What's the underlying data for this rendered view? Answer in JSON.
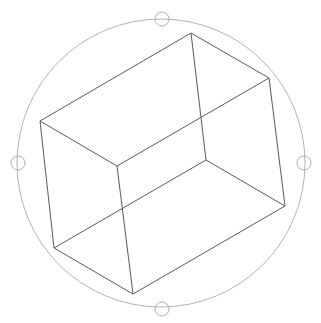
{
  "viewport": {
    "name": "3D Orbit view",
    "background": "#ffffff",
    "width": 321,
    "height": 323
  },
  "arcball": {
    "center": [
      161,
      163
    ],
    "radius": 144,
    "stroke": "#b4b4b4",
    "handles": [
      {
        "id": "top",
        "cx": 162,
        "cy": 19,
        "r": 7
      },
      {
        "id": "left",
        "cx": 18,
        "cy": 163,
        "r": 7
      },
      {
        "id": "right",
        "cx": 304,
        "cy": 163,
        "r": 7
      },
      {
        "id": "bottom",
        "cx": 162,
        "cy": 309,
        "r": 7
      }
    ]
  },
  "wireframe_box": {
    "stroke": "#5a5a5a",
    "vertices": {
      "top": [
        191,
        33
      ],
      "upper_right": [
        269,
        78
      ],
      "left_upper": [
        40,
        121
      ],
      "inner_middle": [
        117,
        166
      ],
      "back_inner": [
        206,
        160
      ],
      "right_lower": [
        285,
        206
      ],
      "left_lower": [
        54,
        248
      ],
      "bottom": [
        133,
        294
      ]
    },
    "edges": [
      [
        "top",
        "upper_right"
      ],
      [
        "top",
        "left_upper"
      ],
      [
        "top",
        "back_inner"
      ],
      [
        "left_upper",
        "inner_middle"
      ],
      [
        "left_upper",
        "left_lower"
      ],
      [
        "inner_middle",
        "upper_right"
      ],
      [
        "inner_middle",
        "bottom"
      ],
      [
        "upper_right",
        "right_lower"
      ],
      [
        "back_inner",
        "right_lower"
      ],
      [
        "back_inner",
        "left_lower"
      ],
      [
        "left_lower",
        "bottom"
      ],
      [
        "bottom",
        "right_lower"
      ]
    ]
  }
}
